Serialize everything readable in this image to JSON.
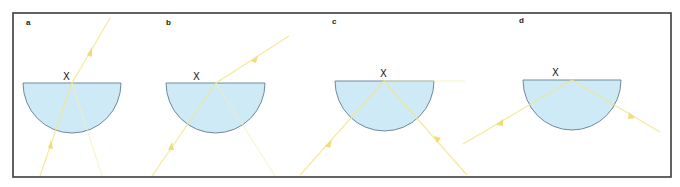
{
  "figure": {
    "type": "ray-diagram",
    "colors": {
      "block_fill": "#cdeaf6",
      "block_outline": "#6f8a9c",
      "ray": "#f3e58a",
      "frame": "#3c3c3c",
      "background": "#ffffff"
    },
    "panels": [
      {
        "id": "a",
        "label": "a",
        "point_label": "X",
        "description": "Ray enters curved face, refracts out of flat face at X (small incidence angle); faint partial reflection back down."
      },
      {
        "id": "b",
        "label": "b",
        "point_label": "X",
        "description": "Larger incidence angle; refracted ray bends further from normal; faint reflected ray inside."
      },
      {
        "id": "c",
        "label": "c",
        "point_label": "X",
        "description": "Critical angle: refracted ray travels along flat surface; reflected ray becomes stronger."
      },
      {
        "id": "d",
        "label": "d",
        "point_label": "X",
        "description": "Angle exceeds critical angle: total internal reflection at X."
      }
    ]
  }
}
